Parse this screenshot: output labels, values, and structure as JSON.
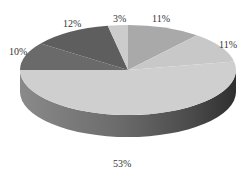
{
  "chart_data": {
    "type": "pie",
    "style": "3d",
    "title": "",
    "slices": [
      {
        "label": "11%",
        "value": 11,
        "color": "#a9a9a9",
        "side": "#7a7a7a"
      },
      {
        "label": "11%",
        "value": 11,
        "color": "#c8c8c8",
        "side": "#3c3c3c"
      },
      {
        "label": "53%",
        "value": 53,
        "color": "#cfcfcf",
        "side": "#6e6e6e"
      },
      {
        "label": "10%",
        "value": 10,
        "color": "#6a6a6a",
        "side": "#5a5a5a"
      },
      {
        "label": "12%",
        "value": 12,
        "color": "#5e5e5e",
        "side": "#505050"
      },
      {
        "label": "3%",
        "value": 3,
        "color": "#cccccc",
        "side": "#9a9a9a"
      }
    ],
    "legend": "none",
    "data_labels": [
      "11%",
      "11%",
      "53%",
      "10%",
      "12%",
      "3%"
    ]
  },
  "labels": {
    "top_right": "11%",
    "right": "11%",
    "bottom": "53%",
    "left": "10%",
    "upper_left": "12%",
    "top": "3%"
  }
}
